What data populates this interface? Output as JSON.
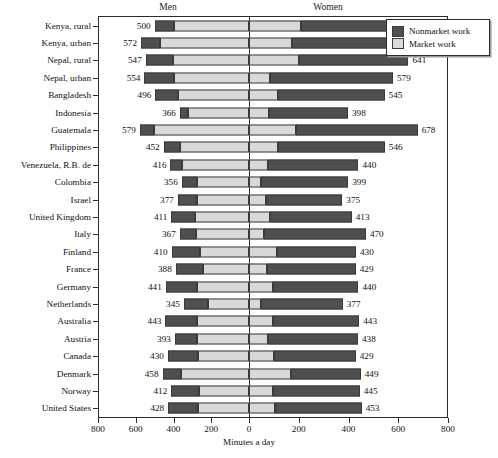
{
  "chart_data": {
    "type": "bar",
    "subtype": "diverging-stacked-population-pyramid",
    "title": "",
    "xlabel": "Minutes a day",
    "ylabel": "",
    "xlim": [
      -800,
      800
    ],
    "grid": false,
    "legend_position": "top-right",
    "panel_headers": [
      "Men",
      "Women"
    ],
    "x_ticks": [
      -800,
      -600,
      -400,
      -200,
      0,
      200,
      400,
      600,
      800
    ],
    "x_tick_labels": [
      "800",
      "600",
      "400",
      "200",
      "0",
      "200",
      "400",
      "600",
      "800"
    ],
    "series": [
      {
        "name": "Nonmarket work",
        "color": "#4f4f4f"
      },
      {
        "name": "Market work",
        "color": "#d9d9d9"
      }
    ],
    "categories": [
      "Kenya, rural",
      "Kenya, urban",
      "Nepal, rural",
      "Nepal, urban",
      "Bangladesh",
      "Indonesia",
      "Guatemala",
      "Philippines",
      "Venezuela, R.B. de",
      "Colombia",
      "Israel",
      "United Kingdom",
      "Italy",
      "Finland",
      "France",
      "Germany",
      "Netherlands",
      "Australia",
      "Austria",
      "Canada",
      "Denmark",
      "Norway",
      "United States"
    ],
    "rows": [
      {
        "category": "Kenya, rural",
        "men_total": 500,
        "men_nonmarket": 105,
        "men_market": 395,
        "women_total": 676,
        "women_nonmarket": 466,
        "women_market": 210
      },
      {
        "category": "Kenya, urban",
        "men_total": 572,
        "men_nonmarket": 100,
        "men_market": 472,
        "women_total": 590,
        "women_nonmarket": 418,
        "women_market": 172
      },
      {
        "category": "Nepal, rural",
        "men_total": 547,
        "men_nonmarket": 142,
        "men_market": 405,
        "women_total": 641,
        "women_nonmarket": 440,
        "women_market": 201
      },
      {
        "category": "Nepal, urban",
        "men_total": 554,
        "men_nonmarket": 158,
        "men_market": 396,
        "women_total": 579,
        "women_nonmarket": 494,
        "women_market": 85
      },
      {
        "category": "Bangladesh",
        "men_total": 496,
        "men_nonmarket": 118,
        "men_market": 378,
        "women_total": 545,
        "women_nonmarket": 430,
        "women_market": 115
      },
      {
        "category": "Indonesia",
        "men_total": 366,
        "men_nonmarket": 42,
        "men_market": 324,
        "women_total": 398,
        "women_nonmarket": 318,
        "women_market": 80
      },
      {
        "category": "Guatemala",
        "men_total": 579,
        "men_nonmarket": 74,
        "men_market": 505,
        "women_total": 678,
        "women_nonmarket": 490,
        "women_market": 188
      },
      {
        "category": "Philippines",
        "men_total": 452,
        "men_nonmarket": 84,
        "men_market": 368,
        "women_total": 546,
        "women_nonmarket": 430,
        "women_market": 116
      },
      {
        "category": "Venezuela, R.B. de",
        "men_total": 416,
        "men_nonmarket": 60,
        "men_market": 356,
        "women_total": 440,
        "women_nonmarket": 362,
        "women_market": 78
      },
      {
        "category": "Colombia",
        "men_total": 356,
        "men_nonmarket": 80,
        "men_market": 276,
        "women_total": 399,
        "women_nonmarket": 352,
        "women_market": 47
      },
      {
        "category": "Israel",
        "men_total": 377,
        "men_nonmarket": 100,
        "men_market": 277,
        "women_total": 375,
        "women_nonmarket": 305,
        "women_market": 70
      },
      {
        "category": "United Kingdom",
        "men_total": 411,
        "men_nonmarket": 125,
        "men_market": 286,
        "women_total": 413,
        "women_nonmarket": 330,
        "women_market": 83
      },
      {
        "category": "Italy",
        "men_total": 367,
        "men_nonmarket": 85,
        "men_market": 282,
        "women_total": 470,
        "women_nonmarket": 410,
        "women_market": 60
      },
      {
        "category": "Finland",
        "men_total": 410,
        "men_nonmarket": 148,
        "men_market": 262,
        "women_total": 430,
        "women_nonmarket": 318,
        "women_market": 112
      },
      {
        "category": "France",
        "men_total": 388,
        "men_nonmarket": 142,
        "men_market": 246,
        "women_total": 429,
        "women_nonmarket": 355,
        "women_market": 74
      },
      {
        "category": "Germany",
        "men_total": 441,
        "men_nonmarket": 164,
        "men_market": 277,
        "women_total": 440,
        "women_nonmarket": 345,
        "women_market": 95
      },
      {
        "category": "Netherlands",
        "men_total": 345,
        "men_nonmarket": 130,
        "men_market": 215,
        "women_total": 377,
        "women_nonmarket": 330,
        "women_market": 47
      },
      {
        "category": "Australia",
        "men_total": 443,
        "men_nonmarket": 168,
        "men_market": 275,
        "women_total": 443,
        "women_nonmarket": 345,
        "women_market": 98
      },
      {
        "category": "Austria",
        "men_total": 393,
        "men_nonmarket": 118,
        "men_market": 275,
        "women_total": 438,
        "women_nonmarket": 362,
        "women_market": 76
      },
      {
        "category": "Canada",
        "men_total": 430,
        "men_nonmarket": 158,
        "men_market": 272,
        "women_total": 429,
        "women_nonmarket": 330,
        "women_market": 99
      },
      {
        "category": "Denmark",
        "men_total": 458,
        "men_nonmarket": 98,
        "men_market": 360,
        "women_total": 449,
        "women_nonmarket": 280,
        "women_market": 169
      },
      {
        "category": "Norway",
        "men_total": 412,
        "men_nonmarket": 145,
        "men_market": 267,
        "women_total": 445,
        "women_nonmarket": 350,
        "women_market": 95
      },
      {
        "category": "United States",
        "men_total": 428,
        "men_nonmarket": 160,
        "men_market": 268,
        "women_total": 453,
        "women_nonmarket": 350,
        "women_market": 103
      }
    ]
  },
  "legend": {
    "items": [
      {
        "label": "Nonmarket work",
        "color": "#4f4f4f"
      },
      {
        "label": "Market work",
        "color": "#d9d9d9"
      }
    ]
  }
}
